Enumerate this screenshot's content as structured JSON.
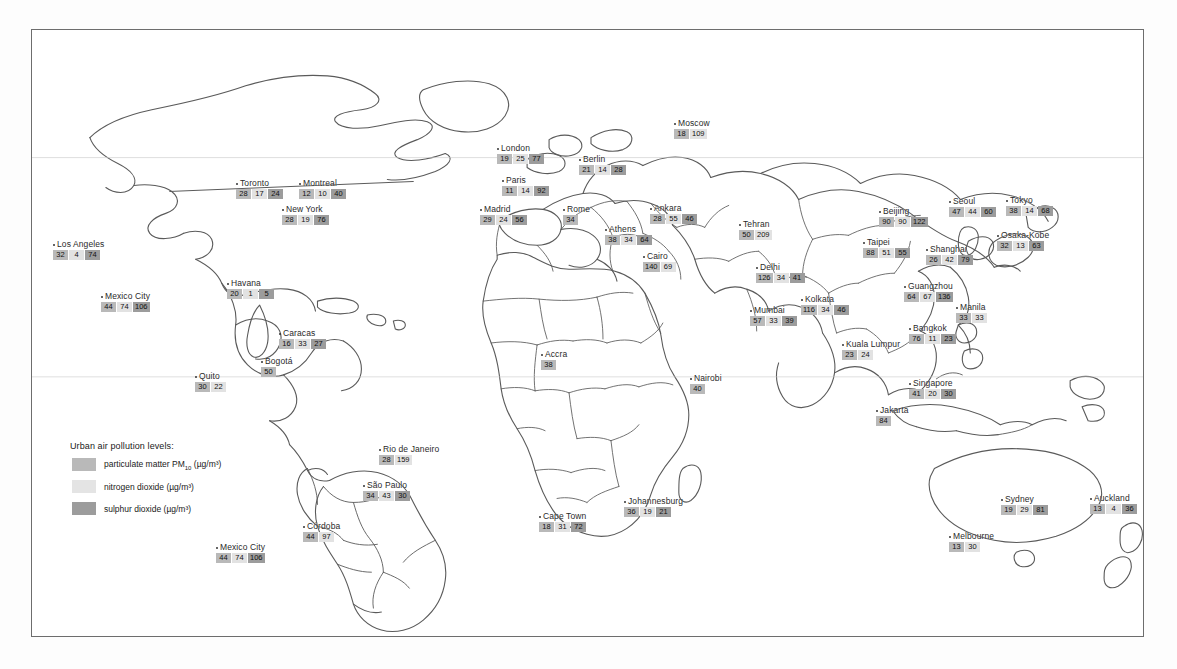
{
  "legend": {
    "title": "Urban air pollution levels:",
    "items": [
      {
        "key": "pm10",
        "label": "particulate matter PM",
        "sub": "10",
        "units": " (µg/m³)",
        "color": "#b9b9b9"
      },
      {
        "key": "no2",
        "label": "nitrogen dioxide",
        "sub": "",
        "units": " (µg/m³)",
        "color": "#e4e4e4"
      },
      {
        "key": "so2",
        "label": "sulphur dioxide",
        "sub": "",
        "units": " (µg/m³)",
        "color": "#9c9c9c"
      }
    ]
  },
  "chart_data": {
    "type": "map",
    "title": "Urban air pollution levels",
    "series": [
      {
        "name": "particulate matter PM10",
        "units": "µg/m³",
        "color": "#b9b9b9"
      },
      {
        "name": "nitrogen dioxide",
        "units": "µg/m³",
        "color": "#e4e4e4"
      },
      {
        "name": "sulphur dioxide",
        "units": "µg/m³",
        "color": "#9c9c9c"
      }
    ],
    "cities": [
      {
        "name": "Toronto",
        "values": [
          "28",
          "17",
          "24"
        ],
        "x": 235,
        "y": 178
      },
      {
        "name": "Montreal",
        "values": [
          "12",
          "10",
          "40"
        ],
        "x": 298,
        "y": 178
      },
      {
        "name": "New York",
        "values": [
          "28",
          "19",
          "76"
        ],
        "x": 281,
        "y": 204
      },
      {
        "name": "Los Angeles",
        "values": [
          "32",
          "4",
          "74"
        ],
        "x": 52,
        "y": 239
      },
      {
        "name": "Mexico City",
        "values": [
          "44",
          "74",
          "106"
        ],
        "x": 100,
        "y": 291
      },
      {
        "name": "Havana",
        "values": [
          "20",
          "1",
          "5"
        ],
        "x": 226,
        "y": 278
      },
      {
        "name": "Caracas",
        "values": [
          "16",
          "33",
          "27"
        ],
        "x": 278,
        "y": 328
      },
      {
        "name": "Bogotá",
        "values": [
          "50"
        ],
        "x": 260,
        "y": 356
      },
      {
        "name": "Quito",
        "values": [
          "30",
          "22"
        ],
        "x": 194,
        "y": 371
      },
      {
        "name": "Rio de Janeiro",
        "values": [
          "28",
          "159"
        ],
        "x": 378,
        "y": 444
      },
      {
        "name": "São Paulo",
        "values": [
          "34",
          "43",
          "30"
        ],
        "x": 362,
        "y": 480
      },
      {
        "name": "Córdoba",
        "values": [
          "44",
          "97"
        ],
        "x": 302,
        "y": 521
      },
      {
        "name": "Mexico City",
        "values": [
          "44",
          "74",
          "106"
        ],
        "x": 215,
        "y": 542
      },
      {
        "name": "London",
        "values": [
          "19",
          "25",
          "77"
        ],
        "x": 496,
        "y": 143
      },
      {
        "name": "Paris",
        "values": [
          "11",
          "14",
          "92"
        ],
        "x": 501,
        "y": 175
      },
      {
        "name": "Berlin",
        "values": [
          "21",
          "14",
          "28"
        ],
        "x": 578,
        "y": 154
      },
      {
        "name": "Madrid",
        "values": [
          "29",
          "24",
          "56"
        ],
        "x": 479,
        "y": 204
      },
      {
        "name": "Rome",
        "values": [
          "34"
        ],
        "x": 562,
        "y": 204
      },
      {
        "name": "Athens",
        "values": [
          "38",
          "34",
          "64"
        ],
        "x": 604,
        "y": 224
      },
      {
        "name": "Moscow",
        "values": [
          "18",
          "109"
        ],
        "x": 673,
        "y": 118
      },
      {
        "name": "Ankara",
        "values": [
          "28",
          "55",
          "46"
        ],
        "x": 649,
        "y": 203
      },
      {
        "name": "Tehran",
        "values": [
          "50",
          "209"
        ],
        "x": 738,
        "y": 219
      },
      {
        "name": "Cairo",
        "values": [
          "140",
          "69"
        ],
        "x": 642,
        "y": 251
      },
      {
        "name": "Accra",
        "values": [
          "38"
        ],
        "x": 540,
        "y": 349
      },
      {
        "name": "Nairobi",
        "values": [
          "40"
        ],
        "x": 689,
        "y": 373
      },
      {
        "name": "Johannesburg",
        "values": [
          "36",
          "19",
          "21"
        ],
        "x": 623,
        "y": 496
      },
      {
        "name": "Cape Town",
        "values": [
          "18",
          "31",
          "72"
        ],
        "x": 538,
        "y": 511
      },
      {
        "name": "Delhi",
        "values": [
          "126",
          "34",
          "41"
        ],
        "x": 755,
        "y": 262
      },
      {
        "name": "Mumbai",
        "values": [
          "57",
          "33",
          "39"
        ],
        "x": 749,
        "y": 305
      },
      {
        "name": "Kolkata",
        "values": [
          "116",
          "34",
          "46"
        ],
        "x": 800,
        "y": 294
      },
      {
        "name": "Kuala Lumpur",
        "values": [
          "23",
          "24"
        ],
        "x": 841,
        "y": 339
      },
      {
        "name": "Singapore",
        "values": [
          "41",
          "20",
          "30"
        ],
        "x": 908,
        "y": 378
      },
      {
        "name": "Jakarta",
        "values": [
          "84"
        ],
        "x": 875,
        "y": 405
      },
      {
        "name": "Bangkok",
        "values": [
          "76",
          "11",
          "23"
        ],
        "x": 908,
        "y": 323
      },
      {
        "name": "Manila",
        "values": [
          "33",
          "33"
        ],
        "x": 955,
        "y": 302
      },
      {
        "name": "Beijing",
        "values": [
          "90",
          "90",
          "122"
        ],
        "x": 878,
        "y": 206
      },
      {
        "name": "Taipei",
        "values": [
          "88",
          "51",
          "55"
        ],
        "x": 862,
        "y": 237
      },
      {
        "name": "Shanghai",
        "values": [
          "26",
          "42",
          "79"
        ],
        "x": 925,
        "y": 244
      },
      {
        "name": "Guangzhou",
        "values": [
          "64",
          "67",
          "136"
        ],
        "x": 903,
        "y": 281
      },
      {
        "name": "Seoul",
        "values": [
          "47",
          "44",
          "60"
        ],
        "x": 948,
        "y": 196
      },
      {
        "name": "Tokyo",
        "values": [
          "38",
          "14",
          "68"
        ],
        "x": 1005,
        "y": 195
      },
      {
        "name": "Osaka-Kobe",
        "values": [
          "32",
          "13",
          "63"
        ],
        "x": 996,
        "y": 230
      },
      {
        "name": "Sydney",
        "values": [
          "19",
          "29",
          "81"
        ],
        "x": 1000,
        "y": 494
      },
      {
        "name": "Melbourne",
        "values": [
          "13",
          "30"
        ],
        "x": 948,
        "y": 531
      },
      {
        "name": "Auckland",
        "values": [
          "13",
          "4",
          "36"
        ],
        "x": 1089,
        "y": 493
      }
    ]
  }
}
